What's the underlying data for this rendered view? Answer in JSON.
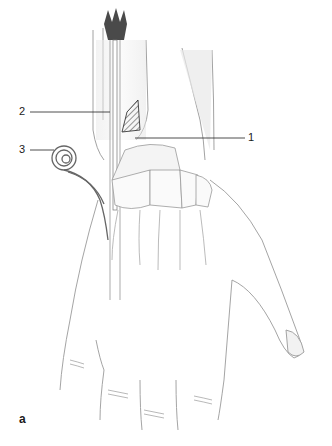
{
  "figure": {
    "panel_label": "a",
    "labels": [
      {
        "id": "1",
        "text": "1"
      },
      {
        "id": "2",
        "text": "2"
      },
      {
        "id": "3",
        "text": "3"
      }
    ]
  }
}
